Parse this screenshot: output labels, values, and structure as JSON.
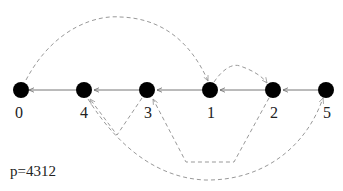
{
  "diagram": {
    "caption": "p=4312",
    "nodes": [
      {
        "id": "0",
        "label": "0",
        "x": 21,
        "y": 90
      },
      {
        "id": "4",
        "label": "4",
        "x": 84,
        "y": 90
      },
      {
        "id": "3",
        "label": "3",
        "x": 147,
        "y": 90
      },
      {
        "id": "1",
        "label": "1",
        "x": 210,
        "y": 90
      },
      {
        "id": "2",
        "label": "2",
        "x": 273,
        "y": 90
      },
      {
        "id": "5",
        "label": "5",
        "x": 326,
        "y": 90
      }
    ],
    "solid_edges": [
      {
        "from": "5",
        "to": "2"
      },
      {
        "from": "2",
        "to": "1"
      },
      {
        "from": "1",
        "to": "3"
      },
      {
        "from": "3",
        "to": "4"
      },
      {
        "from": "4",
        "to": "0"
      }
    ],
    "dashed_edges": [
      {
        "from": "0",
        "to": "1"
      },
      {
        "from": "1",
        "to": "2"
      },
      {
        "from": "3",
        "to": "4"
      },
      {
        "from": "2",
        "to": "3"
      },
      {
        "from": "4",
        "to": "5"
      }
    ],
    "colors": {
      "node": "#000000",
      "solid_edge": "#777777",
      "dashed_edge": "#999999"
    }
  }
}
